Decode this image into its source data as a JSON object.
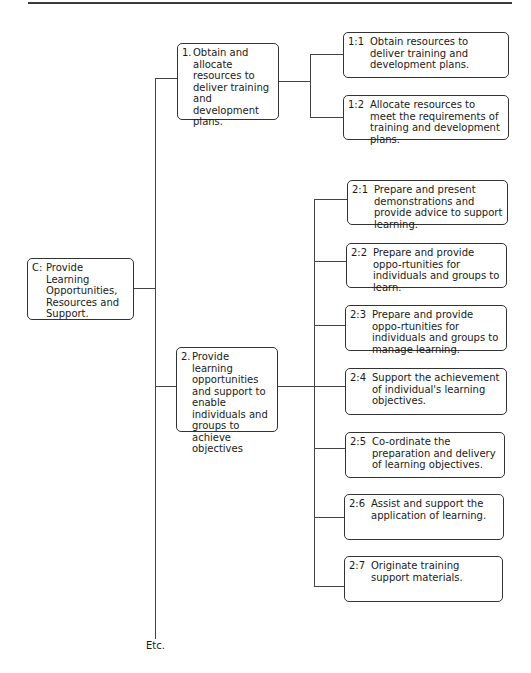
{
  "diagram": {
    "root": {
      "id": "C",
      "prefix": "C:",
      "text": "Provide Learning Opportunities, Resources and Support."
    },
    "units": [
      {
        "prefix": "1.",
        "text": "Obtain and allocate resources to deliver training and development plans.",
        "elements": [
          {
            "prefix": "1:1",
            "text": "Obtain resources to deliver training and development plans."
          },
          {
            "prefix": "1:2",
            "text": "Allocate resources to meet the requirements of training and development plans."
          }
        ]
      },
      {
        "prefix": "2.",
        "text": "Provide learning opportunities and support to enable individuals and groups to achieve objectives",
        "elements": [
          {
            "prefix": "2:1",
            "text": "Prepare and present demonstrations and provide advice to support learning."
          },
          {
            "prefix": "2:2",
            "text": "Prepare and provide oppo-rtunities for individuals and groups to learn."
          },
          {
            "prefix": "2:3",
            "text": "Prepare and provide oppo-rtunities for individuals and groups to manage learning."
          },
          {
            "prefix": "2:4",
            "text": "Support the achievement of individual's learning objectives."
          },
          {
            "prefix": "2:5",
            "text": "Co-ordinate the preparation and delivery of learning objectives."
          },
          {
            "prefix": "2:6",
            "text": "Assist and support the application of learning."
          },
          {
            "prefix": "2:7",
            "text": "Originate training support materials."
          }
        ]
      }
    ],
    "continuation": "Etc."
  }
}
